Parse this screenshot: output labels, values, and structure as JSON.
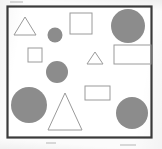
{
  "figure": {
    "background_color": "#fbfbfb",
    "frame": {
      "name": "bounding-box-frame",
      "x": 7.5,
      "y": 6.5,
      "width": 144,
      "height": 131,
      "stroke": "#3a3a3a",
      "stroke_width": 2.2,
      "fill": "#ffffff"
    },
    "palette": {
      "filled_gray": "#8c8c8c",
      "outline_gray": "#9a9a9a",
      "frame_dark": "#3a3a3a",
      "page_background": "#fbfbfb"
    },
    "counts": {
      "total_shapes": 12,
      "circles": 5,
      "triangles": 3,
      "squares": 2,
      "rectangles": 2,
      "filled_shapes": 5,
      "outline_shapes": 7
    },
    "shapes": [
      {
        "id": "triangle-outline-top-left",
        "type": "triangle",
        "style": "outline",
        "stroke": "#9a9a9a",
        "fill": "none",
        "stroke_width": 1,
        "points": "25,17 36,35 14,35",
        "center_x": 25,
        "center_y": 29,
        "size": "medium"
      },
      {
        "id": "circle-filled-small-upper-mid",
        "type": "circle",
        "style": "filled",
        "fill": "#8c8c8c",
        "stroke": "none",
        "cx": 55,
        "cy": 35,
        "r": 7.5,
        "size": "small"
      },
      {
        "id": "square-outline-top-center",
        "type": "square",
        "style": "outline",
        "stroke": "#9a9a9a",
        "fill": "none",
        "stroke_width": 1,
        "x": 70,
        "y": 13,
        "width": 22,
        "height": 21,
        "size": "medium"
      },
      {
        "id": "circle-filled-large-top-right",
        "type": "circle",
        "style": "filled",
        "fill": "#8c8c8c",
        "stroke": "none",
        "cx": 128,
        "cy": 26,
        "r": 17,
        "size": "large"
      },
      {
        "id": "square-outline-small-left",
        "type": "square",
        "style": "outline",
        "stroke": "#9a9a9a",
        "fill": "none",
        "stroke_width": 1,
        "x": 28,
        "y": 48,
        "width": 14,
        "height": 14,
        "size": "small"
      },
      {
        "id": "circle-filled-medium-center-left",
        "type": "circle",
        "style": "filled",
        "fill": "#8c8c8c",
        "stroke": "none",
        "cx": 57,
        "cy": 72,
        "r": 11,
        "size": "medium"
      },
      {
        "id": "triangle-outline-small-center",
        "type": "triangle",
        "style": "outline",
        "stroke": "#9a9a9a",
        "fill": "none",
        "stroke_width": 1,
        "points": "95,52 103,64 87,64",
        "center_x": 95,
        "center_y": 60,
        "size": "small"
      },
      {
        "id": "rectangle-outline-wide-right",
        "type": "rectangle",
        "style": "outline",
        "stroke": "#9a9a9a",
        "fill": "none",
        "stroke_width": 1,
        "x": 114,
        "y": 45,
        "width": 37,
        "height": 19,
        "size": "large"
      },
      {
        "id": "circle-filled-large-bottom-left",
        "type": "circle",
        "style": "filled",
        "fill": "#8c8c8c",
        "stroke": "none",
        "cx": 29,
        "cy": 105,
        "r": 18,
        "size": "large"
      },
      {
        "id": "rectangle-outline-small-center",
        "type": "rectangle",
        "style": "outline",
        "stroke": "#9a9a9a",
        "fill": "none",
        "stroke_width": 1,
        "x": 85,
        "y": 86,
        "width": 25,
        "height": 14,
        "size": "small"
      },
      {
        "id": "triangle-outline-large-bottom-center",
        "type": "triangle",
        "style": "outline",
        "stroke": "#9a9a9a",
        "fill": "none",
        "stroke_width": 1,
        "points": "65,93 82,130 48,130",
        "center_x": 65,
        "center_y": 117,
        "size": "large"
      },
      {
        "id": "circle-filled-large-bottom-right",
        "type": "circle",
        "style": "filled",
        "fill": "#8c8c8c",
        "stroke": "none",
        "cx": 132,
        "cy": 113,
        "r": 16,
        "size": "large"
      }
    ],
    "specks": [
      {
        "x": 10,
        "y": 1,
        "width": 13,
        "height": 2
      },
      {
        "x": 46,
        "y": 142,
        "width": 10,
        "height": 2
      },
      {
        "x": 120,
        "y": 144,
        "width": 16,
        "height": 2
      }
    ]
  }
}
